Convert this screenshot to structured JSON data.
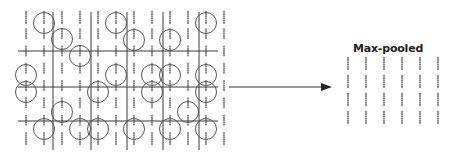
{
  "output_label": "Max-pooled",
  "colors": {
    "dots": "#8a8a8a",
    "grid": "#3a3a3a",
    "circles": "#555555",
    "arrow": "#333333"
  },
  "input_grid": {
    "columns": 12,
    "rows": 8,
    "pool_regions": {
      "cols": 6,
      "rows": 4
    }
  },
  "output_grid": {
    "columns": 6,
    "rows": 4
  }
}
